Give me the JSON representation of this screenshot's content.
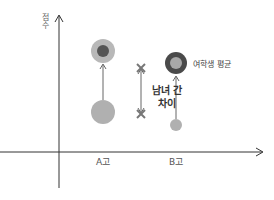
{
  "axes": {
    "y_label": "점수",
    "x_ticks": [
      "A고",
      "B고"
    ]
  },
  "annotations": {
    "difference_label_line1": "남녀 간",
    "difference_label_line2": "차이",
    "legend_label": "여학생 평균"
  },
  "colors": {
    "axis": "#333333",
    "light_circle": "#b0b0b0",
    "dark_circle": "#555555",
    "connector": "#666666",
    "x_mark": "#777777"
  }
}
